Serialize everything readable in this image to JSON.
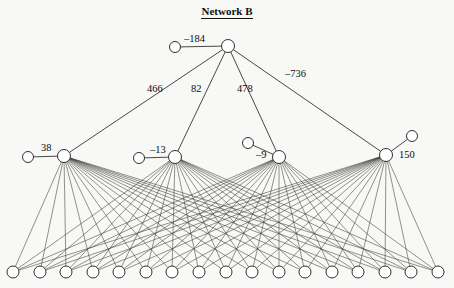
{
  "figure": {
    "title": "Network B",
    "background_color": "#f8f8f6",
    "ink_color": "#1a1a1a",
    "node_fill": "#ffffff"
  },
  "layers": {
    "output": {
      "name": "output-layer",
      "node_count": 1,
      "nodes": [
        {
          "id": "out-1",
          "cx": 228,
          "cy": 46,
          "r": 6.5
        }
      ]
    },
    "hidden": {
      "name": "hidden-layer",
      "node_count": 4,
      "nodes": [
        {
          "id": "hid-1",
          "cx": 64,
          "cy": 156,
          "r": 6.5
        },
        {
          "id": "hid-2",
          "cx": 175,
          "cy": 157,
          "r": 6.5
        },
        {
          "id": "hid-3",
          "cx": 279,
          "cy": 157,
          "r": 6.5
        },
        {
          "id": "hid-4",
          "cx": 386,
          "cy": 155,
          "r": 6.5
        }
      ]
    },
    "input": {
      "name": "input-layer",
      "node_count": 17,
      "y": 272,
      "r": 6,
      "x_positions": [
        13,
        40,
        66,
        93,
        119,
        146,
        172,
        199,
        226,
        252,
        279,
        305,
        332,
        358,
        385,
        411,
        438
      ]
    },
    "bias": {
      "name": "bias-nodes",
      "node_count": 5,
      "nodes": [
        {
          "id": "bias-out",
          "cx": 175,
          "cy": 47,
          "r": 5.5,
          "target": "out-1"
        },
        {
          "id": "bias-hid-1",
          "cx": 28,
          "cy": 157,
          "r": 5.5,
          "target": "hid-1"
        },
        {
          "id": "bias-hid-2",
          "cx": 139,
          "cy": 158,
          "r": 5.5,
          "target": "hid-2"
        },
        {
          "id": "bias-hid-3",
          "cx": 248,
          "cy": 143,
          "r": 5.5,
          "target": "hid-3"
        },
        {
          "id": "bias-hid-4",
          "cx": 412,
          "cy": 136,
          "r": 5.5,
          "target": "hid-4"
        }
      ]
    }
  },
  "weights": {
    "bias_output": {
      "value": "–184",
      "x": 184,
      "y": 34
    },
    "hidden_to_output": [
      {
        "value": "466",
        "x": 147,
        "y": 84,
        "from": "hid-1",
        "to": "out-1"
      },
      {
        "value": "82",
        "x": 191,
        "y": 84,
        "from": "hid-2",
        "to": "out-1"
      },
      {
        "value": "478",
        "x": 237,
        "y": 84,
        "from": "hid-3",
        "to": "out-1"
      },
      {
        "value": "–736",
        "x": 285,
        "y": 69,
        "from": "hid-4",
        "to": "out-1"
      }
    ],
    "bias_hidden": [
      {
        "value": "38",
        "x": 41,
        "y": 143,
        "target": "hid-1"
      },
      {
        "value": "–13",
        "x": 150,
        "y": 145,
        "target": "hid-2"
      },
      {
        "value": "–9",
        "x": 256,
        "y": 150,
        "target": "hid-3"
      },
      {
        "value": "150",
        "x": 399,
        "y": 150,
        "target": "hid-4"
      }
    ]
  },
  "edges": {
    "hidden_to_output_count": 4,
    "input_to_hidden_fully_connected": true,
    "input_to_hidden_count": 68
  }
}
